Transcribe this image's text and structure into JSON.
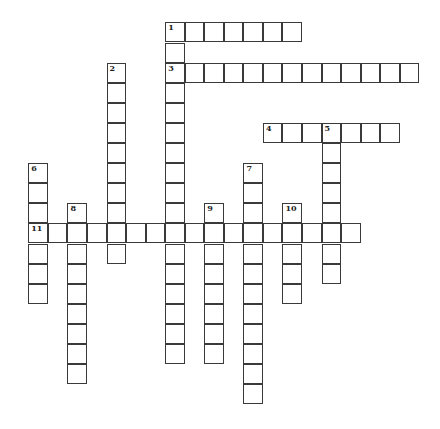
{
  "puzzle": {
    "type": "crossword",
    "layout": {
      "origin_x": 28.3,
      "origin_y": 22.4,
      "cell_w": 19.55,
      "cell_h": 20.1
    },
    "words": [
      {
        "number": "1",
        "direction": "across",
        "row": 0,
        "col": 7,
        "length": 7
      },
      {
        "number": "1",
        "direction": "down",
        "row": 0,
        "col": 7,
        "length": 17
      },
      {
        "number": "2",
        "direction": "down",
        "row": 2,
        "col": 4,
        "length": 10
      },
      {
        "number": "3",
        "direction": "across",
        "row": 2,
        "col": 7,
        "length": 13
      },
      {
        "number": "4",
        "direction": "across",
        "row": 5,
        "col": 12,
        "length": 7
      },
      {
        "number": "5",
        "direction": "down",
        "row": 5,
        "col": 15,
        "length": 8
      },
      {
        "number": "6",
        "direction": "down",
        "row": 7,
        "col": 0,
        "length": 7
      },
      {
        "number": "7",
        "direction": "down",
        "row": 7,
        "col": 11,
        "length": 12
      },
      {
        "number": "8",
        "direction": "down",
        "row": 9,
        "col": 2,
        "length": 9
      },
      {
        "number": "9",
        "direction": "down",
        "row": 9,
        "col": 9,
        "length": 8
      },
      {
        "number": "10",
        "direction": "down",
        "row": 9,
        "col": 13,
        "length": 5
      },
      {
        "number": "11",
        "direction": "across",
        "row": 10,
        "col": 0,
        "length": 17
      }
    ],
    "numbers": [
      {
        "label": "1",
        "row": 0,
        "col": 7
      },
      {
        "label": "2",
        "row": 2,
        "col": 4
      },
      {
        "label": "3",
        "row": 2,
        "col": 7
      },
      {
        "label": "4",
        "row": 5,
        "col": 12
      },
      {
        "label": "5",
        "row": 5,
        "col": 15
      },
      {
        "label": "6",
        "row": 7,
        "col": 0
      },
      {
        "label": "7",
        "row": 7,
        "col": 11
      },
      {
        "label": "8",
        "row": 9,
        "col": 2
      },
      {
        "label": "9",
        "row": 9,
        "col": 9
      },
      {
        "label": "10",
        "row": 9,
        "col": 13
      },
      {
        "label": "11",
        "row": 10,
        "col": 0
      }
    ]
  }
}
